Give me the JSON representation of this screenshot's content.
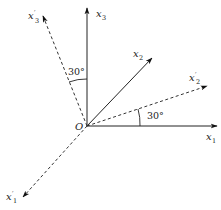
{
  "diagram": {
    "origin_label": "O",
    "axes": [
      {
        "id": "x1",
        "label": "x",
        "subscript": "1",
        "prime": "",
        "style": "solid"
      },
      {
        "id": "x2",
        "label": "x",
        "subscript": "2",
        "prime": "",
        "style": "solid"
      },
      {
        "id": "x3",
        "label": "x",
        "subscript": "3",
        "prime": "",
        "style": "solid"
      },
      {
        "id": "x1p",
        "label": "x",
        "subscript": "1",
        "prime": "′",
        "style": "dashed"
      },
      {
        "id": "x2p",
        "label": "x",
        "subscript": "2",
        "prime": "′",
        "style": "dashed"
      },
      {
        "id": "x3p",
        "label": "x",
        "subscript": "3",
        "prime": "′",
        "style": "dashed"
      }
    ],
    "angles": [
      {
        "id": "angle-x3-x3p",
        "label": "30°"
      },
      {
        "id": "angle-x1-x2p",
        "label": "30°"
      }
    ]
  }
}
